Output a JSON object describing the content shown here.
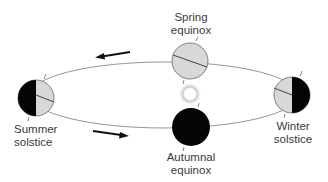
{
  "diagram": {
    "labels": {
      "spring": [
        "Spring",
        "equinox"
      ],
      "summer": [
        "Summer",
        "solstice"
      ],
      "winter": [
        "Winter",
        "solstice"
      ],
      "autumn": [
        "Autumnal",
        "equinox"
      ]
    },
    "nodes": [
      {
        "id": "spring-equinox",
        "shading": "none"
      },
      {
        "id": "summer-solstice",
        "shading": "left-half-dark"
      },
      {
        "id": "winter-solstice",
        "shading": "right-half-dark"
      },
      {
        "id": "autumnal-equinox",
        "shading": "full-dark"
      },
      {
        "id": "sun",
        "shading": "glow"
      }
    ],
    "arrows": [
      {
        "id": "top-arrow",
        "direction": "left"
      },
      {
        "id": "bottom-arrow",
        "direction": "right"
      }
    ],
    "colors": {
      "lit": "#d8d8d8",
      "dark": "#050505",
      "orbit": "#7a7a7a",
      "text": "#3a3a3a"
    }
  }
}
